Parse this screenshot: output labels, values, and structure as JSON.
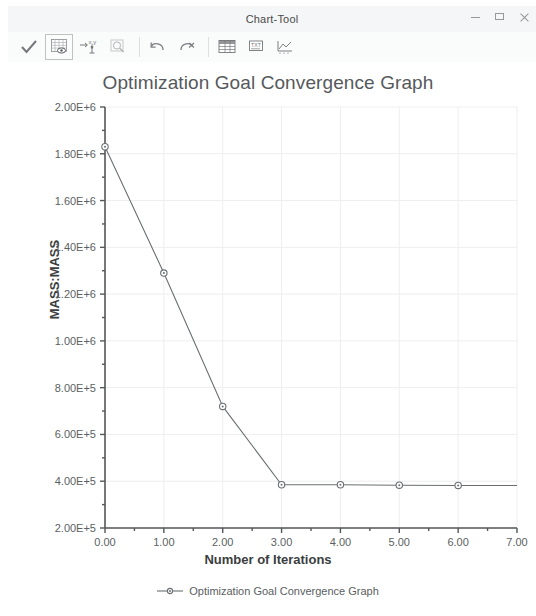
{
  "window": {
    "title": "Chart-Tool",
    "controls": [
      {
        "name": "minimize-button",
        "icon": "minimize-icon",
        "label": "–"
      },
      {
        "name": "maximize-button",
        "icon": "maximize-icon",
        "label": "□"
      },
      {
        "name": "close-button",
        "icon": "close-icon",
        "label": "×"
      }
    ]
  },
  "toolbar": {
    "items": [
      {
        "name": "apply-check-button",
        "icon": "checkmark-icon",
        "tooltip": "Apply"
      },
      {
        "name": "show-grid-button",
        "icon": "grid-table-eye-icon",
        "tooltip": "Show Data Table",
        "active": true
      },
      {
        "name": "axis-scale-button",
        "icon": "axis-exponent-icon",
        "tooltip": "Axis Scale"
      },
      {
        "name": "zoom-button",
        "icon": "magnifier-icon",
        "tooltip": "Zoom"
      },
      {
        "name": "undo-button",
        "icon": "undo-arrow-icon",
        "tooltip": "Undo"
      },
      {
        "name": "redo-button",
        "icon": "redo-arrow-icon",
        "tooltip": "Redo"
      },
      {
        "name": "table-view-button",
        "icon": "spreadsheet-icon",
        "tooltip": "Table View"
      },
      {
        "name": "text-annotate-button",
        "icon": "text-box-icon",
        "tooltip": "Annotate"
      },
      {
        "name": "export-button",
        "icon": "export-chart-icon",
        "tooltip": "Export"
      }
    ]
  },
  "chart_data": {
    "type": "line",
    "title": "Optimization Goal Convergence Graph",
    "xlabel": "Number of Iterations",
    "ylabel": "MASS:MASS",
    "x": [
      0,
      1,
      2,
      3,
      4,
      5,
      6,
      7
    ],
    "values": [
      1830000,
      1290000,
      720000,
      385000,
      385000,
      383000,
      382000,
      382000
    ],
    "series": [
      {
        "name": "Optimization Goal Convergence Graph",
        "values": [
          1830000,
          1290000,
          720000,
          385000,
          385000,
          383000,
          382000,
          382000
        ]
      }
    ],
    "xlim": [
      0,
      7
    ],
    "ylim": [
      200000,
      2000000
    ],
    "xticks": [
      0,
      1,
      2,
      3,
      4,
      5,
      6,
      7
    ],
    "xtick_labels": [
      "0.00",
      "1.00",
      "2.00",
      "3.00",
      "4.00",
      "5.00",
      "6.00",
      "7.00"
    ],
    "yticks": [
      2000000,
      1800000,
      1600000,
      1400000,
      1200000,
      1000000,
      800000,
      600000,
      400000,
      200000
    ],
    "ytick_labels": [
      "2.00E+6",
      "1.80E+6",
      "1.60E+6",
      "1.40E+6",
      "1.20E+6",
      "1.00E+6",
      "8.00E+5",
      "6.00E+5",
      "4.00E+5",
      "2.00E+5"
    ],
    "grid": true,
    "legend_position": "bottom",
    "legend": [
      "Optimization Goal Convergence Graph"
    ],
    "line_color": "#6b6f72",
    "marker": "circle",
    "marker_color": "#6b6f72"
  }
}
